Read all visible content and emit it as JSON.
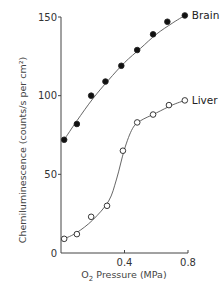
{
  "chart_data": {
    "type": "scatter",
    "title": "",
    "xlabel": "O2 Pressure (MPa)",
    "xlabel_main": "O",
    "xlabel_sub": "2",
    "xlabel_rest": " Pressure (MPa)",
    "ylabel": "Chemiluminescence  (counts/s per cm²)",
    "xlim": [
      0,
      0.8
    ],
    "ylim": [
      0,
      150
    ],
    "xticks": [
      0.4,
      0.8
    ],
    "xtick_labels": [
      "0.4",
      "0.8"
    ],
    "yticks": [
      0,
      50,
      100,
      150
    ],
    "ytick_labels": [
      "0",
      "50",
      "100",
      "150"
    ],
    "grid": false,
    "legend": "inline labels at end of curves",
    "series": [
      {
        "name": "Brain",
        "marker": "filled-circle",
        "x": [
          0.02,
          0.1,
          0.19,
          0.28,
          0.38,
          0.48,
          0.58,
          0.67,
          0.78
        ],
        "values": [
          72,
          82,
          100,
          109,
          119,
          129,
          139,
          147,
          151
        ]
      },
      {
        "name": "Liver",
        "marker": "open-circle",
        "x": [
          0.02,
          0.1,
          0.19,
          0.29,
          0.39,
          0.48,
          0.58,
          0.68,
          0.78
        ],
        "values": [
          9,
          12,
          23,
          30,
          65,
          83,
          88,
          94,
          97
        ]
      }
    ]
  }
}
